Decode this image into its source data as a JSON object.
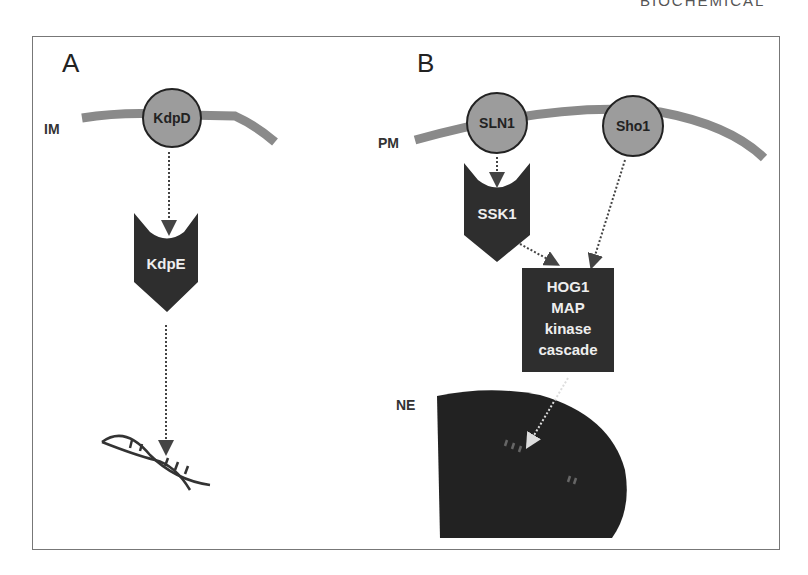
{
  "header": {
    "running_title": "BIOCHEMICAL"
  },
  "panel_a": {
    "label": "A",
    "membrane_label": "IM",
    "sensor": "KdpD",
    "regulator": "KdpE",
    "target": "dna-icon"
  },
  "panel_b": {
    "label": "B",
    "membrane_label": "PM",
    "nucleus_label": "NE",
    "sensors": [
      "SLN1",
      "Sho1"
    ],
    "regulator": "SSK1",
    "cascade": {
      "line1": "HOG1",
      "line2": "MAP",
      "line3": "kinase",
      "line4": "cascade"
    },
    "target": "dna-icon"
  },
  "colors": {
    "membrane": "#8a8a8a",
    "sensor_fill": "#9c9c9c",
    "dark_node": "#2e2e2e",
    "nucleus": "#222222",
    "frame": "#777777"
  }
}
